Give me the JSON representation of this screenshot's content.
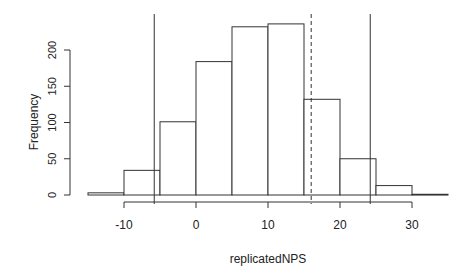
{
  "chart_data": {
    "type": "bar",
    "subtype": "histogram",
    "title": "",
    "xlabel": "replicatedNPS",
    "ylabel": "Frequency",
    "bin_width": 5,
    "bins": [
      {
        "x0": -15,
        "x1": -10,
        "count": 3
      },
      {
        "x0": -10,
        "x1": -5,
        "count": 34
      },
      {
        "x0": -5,
        "x1": 0,
        "count": 101
      },
      {
        "x0": 0,
        "x1": 5,
        "count": 184
      },
      {
        "x0": 5,
        "x1": 10,
        "count": 232
      },
      {
        "x0": 10,
        "x1": 15,
        "count": 236
      },
      {
        "x0": 15,
        "x1": 20,
        "count": 132
      },
      {
        "x0": 20,
        "x1": 25,
        "count": 50
      },
      {
        "x0": 25,
        "x1": 30,
        "count": 13
      },
      {
        "x0": 30,
        "x1": 35,
        "count": 1
      }
    ],
    "x_ticks": [
      -10,
      0,
      10,
      20,
      30
    ],
    "y_ticks": [
      0,
      50,
      100,
      150,
      200
    ],
    "xlim": [
      -15,
      35
    ],
    "ylim": [
      0,
      240
    ],
    "reference_lines": [
      {
        "x": -5.8,
        "style": "solid"
      },
      {
        "x": 24.2,
        "style": "solid"
      },
      {
        "x": 16.0,
        "style": "dashed"
      }
    ],
    "grid": false,
    "legend": null
  },
  "labels": {
    "x_axis": "replicatedNPS",
    "y_axis": "Frequency",
    "x_ticks": [
      "-10",
      "0",
      "10",
      "20",
      "30"
    ],
    "y_ticks": [
      "0",
      "50",
      "100",
      "150",
      "200"
    ]
  }
}
